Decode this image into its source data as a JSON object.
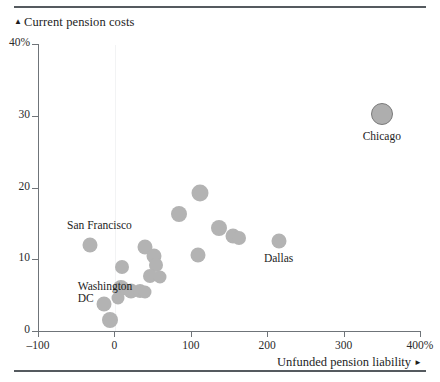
{
  "chart_data": {
    "type": "scatter",
    "title": "Current pension costs",
    "title_marker": "▲",
    "xlabel": "Unfunded pension liability",
    "xlabel_marker": "►",
    "ylabel": "Current pension costs",
    "xlim": [
      -100,
      400
    ],
    "ylim": [
      0,
      40
    ],
    "xticks": [
      -100,
      0,
      100,
      200,
      300,
      400
    ],
    "xtick_labels": [
      "–100",
      "0",
      "100",
      "200",
      "300",
      "400%"
    ],
    "yticks": [
      0,
      10,
      20,
      30,
      40
    ],
    "ytick_labels": [
      "0",
      "10",
      "20",
      "30",
      "40%"
    ],
    "grid": false,
    "zero_gridline": true,
    "legend": "none",
    "marker_color": "#b3b3b3",
    "emphasis_marker_color": "#aeaeae",
    "emphasis_marker_border": "#7a7a7a",
    "axis_color": "#6f7479",
    "points": [
      {
        "label": "Chicago",
        "x": 350,
        "y": 30.2,
        "size": 22,
        "emphasis": true
      },
      {
        "label": "San Francisco",
        "x": -32,
        "y": 12.0,
        "size": 15
      },
      {
        "label": "Washington DC",
        "x": -13,
        "y": 3.7,
        "size": 15
      },
      {
        "label": "Dallas",
        "x": 215,
        "y": 12.6,
        "size": 15
      },
      {
        "label": "",
        "x": 112,
        "y": 19.3,
        "size": 17
      },
      {
        "label": "",
        "x": 85,
        "y": 16.3,
        "size": 16
      },
      {
        "label": "",
        "x": 137,
        "y": 14.3,
        "size": 16
      },
      {
        "label": "",
        "x": 155,
        "y": 13.2,
        "size": 15
      },
      {
        "label": "",
        "x": 163,
        "y": 12.9,
        "size": 14
      },
      {
        "label": "",
        "x": 110,
        "y": 10.6,
        "size": 15
      },
      {
        "label": "",
        "x": 40,
        "y": 11.7,
        "size": 15
      },
      {
        "label": "",
        "x": 10,
        "y": 8.9,
        "size": 14
      },
      {
        "label": "",
        "x": 52,
        "y": 10.5,
        "size": 15
      },
      {
        "label": "",
        "x": 55,
        "y": 9.2,
        "size": 14
      },
      {
        "label": "",
        "x": 47,
        "y": 7.7,
        "size": 14
      },
      {
        "label": "",
        "x": 60,
        "y": 7.5,
        "size": 13
      },
      {
        "label": "",
        "x": 8,
        "y": 6.0,
        "size": 16
      },
      {
        "label": "",
        "x": 22,
        "y": 5.6,
        "size": 15
      },
      {
        "label": "",
        "x": 33,
        "y": 5.6,
        "size": 14
      },
      {
        "label": "",
        "x": 40,
        "y": 5.5,
        "size": 13
      },
      {
        "label": "",
        "x": 5,
        "y": 4.6,
        "size": 13
      },
      {
        "label": "",
        "x": -6,
        "y": 1.6,
        "size": 16
      }
    ],
    "annotations": [
      {
        "text": "San Francisco",
        "x": -62,
        "y": 14.6,
        "align": "left"
      },
      {
        "text": "Washington\nDC",
        "x": -48,
        "y": 6.2,
        "align": "left"
      },
      {
        "text": "Dallas",
        "x": 215,
        "y": 10.0,
        "align": "center"
      },
      {
        "text": "Chicago",
        "x": 350,
        "y": 27.0,
        "align": "center"
      }
    ]
  }
}
